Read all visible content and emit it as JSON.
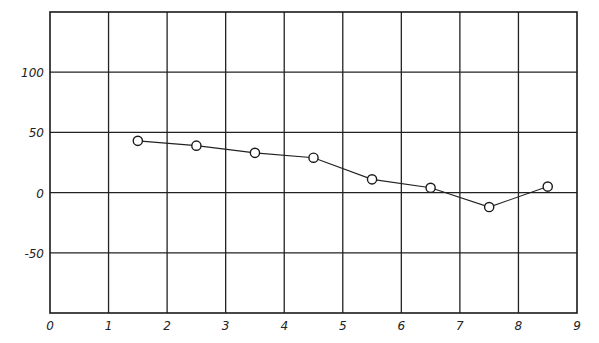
{
  "chart_data": {
    "type": "line",
    "title": "",
    "xlabel": "",
    "ylabel": "",
    "xlim": [
      0,
      9
    ],
    "ylim": [
      -100,
      150
    ],
    "grid": true,
    "legend": null,
    "x_ticks": [
      0,
      1,
      2,
      3,
      4,
      5,
      6,
      7,
      8,
      9
    ],
    "x_tick_labels": [
      "0",
      "1",
      "2",
      "3",
      "4",
      "5",
      "6",
      "7",
      "8",
      "9"
    ],
    "y_ticks": [
      -50,
      0,
      50,
      100
    ],
    "y_tick_labels": [
      "-50",
      "0",
      "50",
      "100"
    ],
    "series": [
      {
        "name": "series-1",
        "marker": "open-circle",
        "color": "#222222",
        "x": [
          1.5,
          2.5,
          3.5,
          4.5,
          5.5,
          6.5,
          7.5,
          8.5
        ],
        "values": [
          43,
          39,
          33,
          29,
          11,
          4,
          -12,
          5
        ]
      }
    ]
  }
}
